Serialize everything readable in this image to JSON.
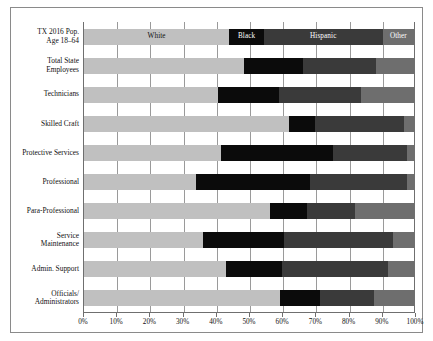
{
  "chart_data": {
    "type": "bar",
    "orientation": "horizontal",
    "stacked": true,
    "normalized": true,
    "title": "",
    "xlabel": "",
    "ylabel": "",
    "xlim": [
      0,
      100
    ],
    "xtick_labels": [
      "0%",
      "10%",
      "20%",
      "30%",
      "40%",
      "50%",
      "60%",
      "70%",
      "80%",
      "90%",
      "100%"
    ],
    "xtick_values": [
      0,
      10,
      20,
      30,
      40,
      50,
      60,
      70,
      80,
      90,
      100
    ],
    "grid": "vertical",
    "legend_position": "inside-first-bar",
    "series": [
      {
        "name": "White",
        "color": "#c0c0c0",
        "values": [
          44.0,
          48.5,
          40.5,
          62.0,
          41.5,
          34.0,
          56.5,
          36.0,
          43.0,
          59.5
        ]
      },
      {
        "name": "Black",
        "color": "#0b0b0b",
        "values": [
          10.5,
          18.0,
          18.5,
          8.0,
          34.0,
          34.5,
          11.0,
          24.5,
          17.0,
          12.0
        ]
      },
      {
        "name": "Hispanic",
        "color": "#3a3a3a",
        "values": [
          36.0,
          22.0,
          25.0,
          27.0,
          22.5,
          29.5,
          14.5,
          33.0,
          32.0,
          16.5
        ]
      },
      {
        "name": "Other",
        "color": "#6e6e6e",
        "values": [
          9.5,
          11.5,
          16.0,
          3.0,
          2.0,
          2.0,
          18.0,
          6.5,
          8.0,
          12.0
        ]
      }
    ],
    "categories": [
      "TX 2016 Pop.\nAge 18–64",
      "Total State\nEmployees",
      "Technicians",
      "Skilled Craft",
      "Protective Services",
      "Professional",
      "Para-Professional",
      "Service\nMaintenance",
      "Admin. Support",
      "Officials/\nAdministrators"
    ],
    "legend_labels": [
      "White",
      "Black",
      "Hispanic",
      "Other"
    ]
  },
  "colors": {
    "white_segment": "#c0c0c0",
    "black_segment": "#0b0b0b",
    "hispanic_segment": "#3a3a3a",
    "other_segment": "#6e6e6e",
    "grid": "#9a9a9a",
    "axis": "#6f6f6f",
    "frame": "#8a8a8a",
    "background": "#ffffff"
  }
}
